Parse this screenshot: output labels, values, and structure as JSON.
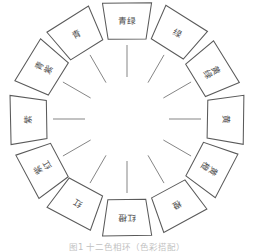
{
  "figure": {
    "title": "十二色相环",
    "caption": "图1  十二色相环（色彩搭配）",
    "wheel": {
      "segment_count": 12,
      "hub_label": "",
      "line_color": "#5a5a5a",
      "card_fill": "#ffffff",
      "text_color": "#3a3a3a"
    },
    "segments": [
      {
        "index": 0,
        "angle_deg": 0,
        "label": "青绿",
        "orientation": "horizontal",
        "position": "top"
      },
      {
        "index": 1,
        "angle_deg": 30,
        "label": "绿",
        "orientation": "horizontal",
        "position": "upper-right"
      },
      {
        "index": 2,
        "angle_deg": 60,
        "label": "黄绿",
        "orientation": "vertical",
        "position": "right-upper"
      },
      {
        "index": 3,
        "angle_deg": 90,
        "label": "黄",
        "orientation": "horizontal",
        "position": "right"
      },
      {
        "index": 4,
        "angle_deg": 120,
        "label": "黄橙",
        "orientation": "vertical",
        "position": "right-lower"
      },
      {
        "index": 5,
        "angle_deg": 150,
        "label": "橙",
        "orientation": "horizontal",
        "position": "lower-right"
      },
      {
        "index": 6,
        "angle_deg": 180,
        "label": "红橙",
        "orientation": "horizontal",
        "position": "bottom"
      },
      {
        "index": 7,
        "angle_deg": 210,
        "label": "红",
        "orientation": "horizontal",
        "position": "lower-left"
      },
      {
        "index": 8,
        "angle_deg": 240,
        "label": "紫红",
        "orientation": "vertical",
        "position": "left-lower"
      },
      {
        "index": 9,
        "angle_deg": 270,
        "label": "紫",
        "orientation": "horizontal",
        "position": "left"
      },
      {
        "index": 10,
        "angle_deg": 300,
        "label": "青紫",
        "orientation": "vertical",
        "position": "left-upper"
      },
      {
        "index": 11,
        "angle_deg": 330,
        "label": "青",
        "orientation": "horizontal",
        "position": "upper-left"
      }
    ]
  }
}
